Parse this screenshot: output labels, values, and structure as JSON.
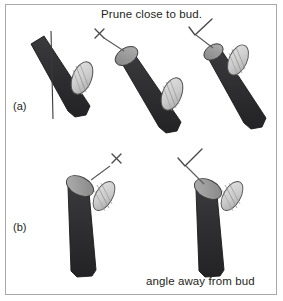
{
  "figure": {
    "title_caption": "Prune close to bud.",
    "bottom_caption": "angle away from bud",
    "panels": [
      {
        "id": "a",
        "label": "(a)"
      },
      {
        "id": "b",
        "label": "(b)"
      }
    ],
    "colors": {
      "frame_border": "#a9a9a9",
      "background": "#ffffff",
      "stem_dark": "#2f2f32",
      "stem_outline": "#1a1a1c",
      "cut_face_gray": "#9a9a9a",
      "cut_face_light": "#b5b5b5",
      "bud_light": "#d2d2d2",
      "bud_outline": "#4a4a4a",
      "mark_stroke": "#4a4a4a",
      "text": "#231f20",
      "cut_line": "#3a3a3a"
    },
    "marks": [
      {
        "name": "x-mark-a",
        "symbol": "×",
        "meaning": "incorrect",
        "panel": "a"
      },
      {
        "name": "check-mark-a",
        "symbol": "✓",
        "meaning": "correct",
        "panel": "a"
      },
      {
        "name": "x-mark-b",
        "symbol": "×",
        "meaning": "incorrect",
        "panel": "b"
      },
      {
        "name": "check-mark-b",
        "symbol": "✓",
        "meaning": "correct",
        "panel": "b"
      }
    ],
    "diagrams": [
      {
        "name": "stem-a-1",
        "panel": "a",
        "description": "diagonal stem with vertical cut line far from bud",
        "has_cut_line": true,
        "cut_face": "none"
      },
      {
        "name": "stem-a-2",
        "panel": "a",
        "description": "diagonal stem cut too far above bud, large exposed cut face",
        "has_cut_line": false,
        "cut_face": "large",
        "verdict": "incorrect"
      },
      {
        "name": "stem-a-3",
        "panel": "a",
        "description": "diagonal stem cut close to bud, small cut face",
        "has_cut_line": false,
        "cut_face": "small",
        "verdict": "correct"
      },
      {
        "name": "stem-b-1",
        "panel": "b",
        "description": "upright stem cut angled toward the bud",
        "angle": "toward bud",
        "verdict": "incorrect"
      },
      {
        "name": "stem-b-2",
        "panel": "b",
        "description": "upright stem cut angled away from the bud",
        "angle": "away from bud",
        "verdict": "correct"
      }
    ]
  }
}
